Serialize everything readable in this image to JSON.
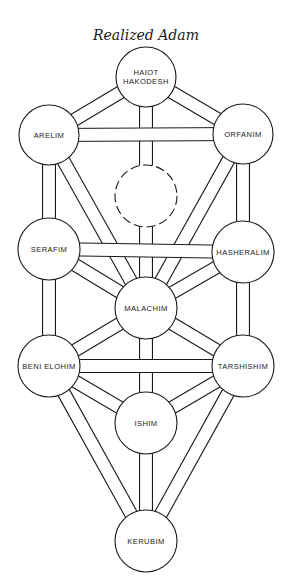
{
  "title": "Realized Adam",
  "colors": {
    "line": "#1a1a1a",
    "fill": "#ffffff",
    "text": "#222222"
  },
  "nodes": {
    "haiot": {
      "lines": [
        "HAIOT",
        "HAKODESH"
      ],
      "cx": 146,
      "cy": 77,
      "r": 30,
      "dashed": false
    },
    "arelim": {
      "lines": [
        "ARELIM"
      ],
      "cx": 49,
      "cy": 135,
      "r": 30,
      "dashed": false
    },
    "orfanim": {
      "lines": [
        "ORFANIM"
      ],
      "cx": 243,
      "cy": 134,
      "r": 30,
      "dashed": false
    },
    "hidden": {
      "lines": [],
      "cx": 146,
      "cy": 196,
      "r": 31,
      "dashed": true
    },
    "serafim": {
      "lines": [
        "SERAFIM"
      ],
      "cx": 49,
      "cy": 249,
      "r": 31,
      "dashed": false
    },
    "hasheralim": {
      "lines": [
        "HASHERALIM"
      ],
      "cx": 243,
      "cy": 252,
      "r": 31,
      "dashed": false
    },
    "malachim": {
      "lines": [
        "MALACHIM"
      ],
      "cx": 146,
      "cy": 308,
      "r": 31,
      "dashed": false
    },
    "beni": {
      "lines": [
        "BENI ELOHIM"
      ],
      "cx": 49,
      "cy": 366,
      "r": 31,
      "dashed": false
    },
    "tarshishim": {
      "lines": [
        "TARSHISHIM"
      ],
      "cx": 243,
      "cy": 366,
      "r": 31,
      "dashed": false
    },
    "ishim": {
      "lines": [
        "ISHIM"
      ],
      "cx": 146,
      "cy": 423,
      "r": 31,
      "dashed": false
    },
    "kerubim": {
      "lines": [
        "KERUBIM"
      ],
      "cx": 146,
      "cy": 541,
      "r": 31,
      "dashed": false
    }
  },
  "paths": [
    [
      "haiot",
      "arelim"
    ],
    [
      "haiot",
      "orfanim"
    ],
    [
      "haiot",
      "hidden"
    ],
    [
      "arelim",
      "orfanim"
    ],
    [
      "arelim",
      "serafim"
    ],
    [
      "orfanim",
      "hasheralim"
    ],
    [
      "arelim",
      "malachim"
    ],
    [
      "orfanim",
      "malachim"
    ],
    [
      "hidden",
      "malachim"
    ],
    [
      "serafim",
      "hasheralim"
    ],
    [
      "serafim",
      "malachim"
    ],
    [
      "hasheralim",
      "malachim"
    ],
    [
      "serafim",
      "beni"
    ],
    [
      "hasheralim",
      "tarshishim"
    ],
    [
      "malachim",
      "beni"
    ],
    [
      "malachim",
      "tarshishim"
    ],
    [
      "malachim",
      "ishim"
    ],
    [
      "beni",
      "tarshishim"
    ],
    [
      "beni",
      "ishim"
    ],
    [
      "tarshishim",
      "ishim"
    ],
    [
      "beni",
      "kerubim"
    ],
    [
      "tarshishim",
      "kerubim"
    ],
    [
      "ishim",
      "kerubim"
    ]
  ],
  "path_width": 14
}
